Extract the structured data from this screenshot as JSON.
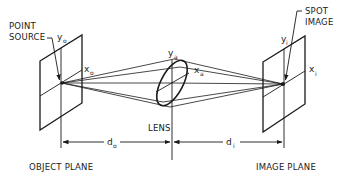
{
  "diagram": {
    "labels": {
      "point_source_line1": "POINT",
      "point_source_line2": "SOURCE",
      "spot_image_line1": "SPOT",
      "spot_image_line2": "IMAGE",
      "lens": "LENS",
      "object_plane": "OBJECT PLANE",
      "image_plane": "IMAGE PLANE"
    },
    "axes": {
      "object_y": "y",
      "object_y_sub": "o",
      "object_x": "x",
      "object_x_sub": "o",
      "lens_y": "y",
      "lens_y_sub": "a",
      "lens_x": "x",
      "lens_x_sub": "a",
      "image_y": "y",
      "image_y_sub": "i",
      "image_x": "x",
      "image_x_sub": "i"
    },
    "dimensions": {
      "object_distance": "d",
      "object_distance_sub": "o",
      "image_distance": "d",
      "image_distance_sub": "i"
    },
    "colors": {
      "line": "#1a1a1a",
      "background": "#ffffff"
    }
  }
}
